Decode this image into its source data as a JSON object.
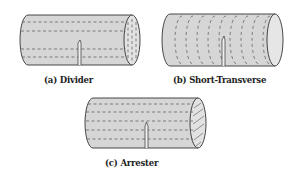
{
  "figure": {
    "panels": [
      {
        "id": "a",
        "label": "(a) Divider",
        "crack_orientation": "divider",
        "layer_direction": "axial"
      },
      {
        "id": "b",
        "label": "(b) Short-Transverse",
        "crack_orientation": "short-transverse",
        "layer_direction": "circumferential"
      },
      {
        "id": "c",
        "label": "(c) Arrester",
        "crack_orientation": "arrester",
        "layer_direction": "axial"
      }
    ]
  },
  "colors": {
    "fill": "#d6d6d6",
    "end_fill": "#e4e4e4",
    "stroke": "#333333",
    "dash": "#555555"
  }
}
